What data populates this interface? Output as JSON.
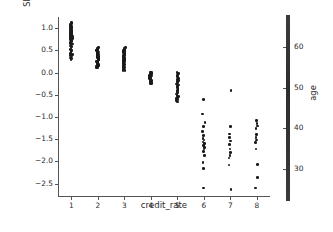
{
  "chart_data": {
    "type": "scatter",
    "title": "",
    "xlabel": "credit_rate",
    "ylabel_line1": "SHAP value for",
    "ylabel_line2": "credit_rate",
    "xlim": [
      0.5,
      8.5
    ],
    "ylim": [
      -2.8,
      1.25
    ],
    "grid": false,
    "xticks": [
      1,
      2,
      3,
      4,
      5,
      6,
      7,
      8
    ],
    "xticklabels": [
      "1",
      "2",
      "3",
      "4",
      "5",
      "6",
      "7",
      "8"
    ],
    "yticks": [
      1.0,
      0.5,
      0.0,
      -0.5,
      -1.0,
      -1.5,
      -2.0,
      -2.5
    ],
    "yticklabels": [
      "1.0",
      "0.5",
      "0.0",
      "−0.5",
      "−1.0",
      "−1.5",
      "−2.0",
      "−2.5"
    ],
    "point_color": "#1a1a1a",
    "axis_color": "#545454",
    "series": [
      {
        "name": "credit_rate = 1",
        "x": 1,
        "values": [
          1.12,
          1.1,
          1.08,
          1.06,
          1.05,
          1.04,
          1.02,
          1.01,
          1.0,
          0.99,
          0.98,
          0.96,
          0.95,
          0.94,
          0.92,
          0.91,
          0.9,
          0.88,
          0.87,
          0.86,
          0.84,
          0.83,
          0.82,
          0.8,
          0.79,
          0.78,
          0.76,
          0.75,
          0.73,
          0.72,
          0.7,
          0.68,
          0.66,
          0.64,
          0.62,
          0.6,
          0.58,
          0.55,
          0.52,
          0.5,
          0.47,
          0.45,
          0.43,
          0.41,
          0.39,
          0.37,
          0.35,
          0.33,
          0.31,
          0.29
        ]
      },
      {
        "name": "credit_rate = 2",
        "x": 2,
        "values": [
          0.57,
          0.55,
          0.54,
          0.53,
          0.52,
          0.51,
          0.5,
          0.49,
          0.48,
          0.47,
          0.46,
          0.45,
          0.44,
          0.43,
          0.42,
          0.41,
          0.4,
          0.39,
          0.38,
          0.37,
          0.36,
          0.35,
          0.34,
          0.33,
          0.32,
          0.31,
          0.3,
          0.29,
          0.28,
          0.27,
          0.26,
          0.25,
          0.24,
          0.22,
          0.21,
          0.2,
          0.19,
          0.18,
          0.17,
          0.16,
          0.15,
          0.14,
          0.13,
          0.12,
          0.11
        ]
      },
      {
        "name": "credit_rate = 3",
        "x": 3,
        "values": [
          0.56,
          0.55,
          0.54,
          0.53,
          0.52,
          0.5,
          0.49,
          0.48,
          0.47,
          0.46,
          0.45,
          0.44,
          0.43,
          0.41,
          0.4,
          0.39,
          0.38,
          0.37,
          0.36,
          0.35,
          0.34,
          0.33,
          0.31,
          0.3,
          0.29,
          0.28,
          0.27,
          0.26,
          0.25,
          0.24,
          0.22,
          0.21,
          0.2,
          0.18,
          0.17,
          0.15,
          0.14,
          0.12,
          0.11,
          0.09,
          0.08,
          0.07,
          0.06,
          0.05,
          0.04
        ]
      },
      {
        "name": "credit_rate = 4",
        "x": 4,
        "values": [
          0.01,
          0.0,
          -0.01,
          -0.02,
          -0.03,
          -0.04,
          -0.05,
          -0.06,
          -0.07,
          -0.08,
          -0.09,
          -0.1,
          -0.11,
          -0.12,
          -0.13,
          -0.14,
          -0.15,
          -0.16,
          -0.17,
          -0.18,
          -0.19,
          -0.2,
          -0.21,
          -0.22,
          -0.23,
          -0.24,
          -0.25,
          -0.26
        ]
      },
      {
        "name": "credit_rate = 5",
        "x": 5,
        "values": [
          0.0,
          -0.02,
          -0.04,
          -0.06,
          -0.08,
          -0.1,
          -0.12,
          -0.14,
          -0.16,
          -0.18,
          -0.2,
          -0.22,
          -0.24,
          -0.26,
          -0.28,
          -0.3,
          -0.32,
          -0.34,
          -0.36,
          -0.38,
          -0.4,
          -0.42,
          -0.44,
          -0.46,
          -0.48,
          -0.5,
          -0.52,
          -0.54,
          -0.56,
          -0.58,
          -0.6,
          -0.62,
          -0.64,
          -0.66
        ]
      },
      {
        "name": "credit_rate = 6",
        "x": 6,
        "values": [
          -0.6,
          -0.93,
          -1.12,
          -1.22,
          -1.32,
          -1.42,
          -1.48,
          -1.52,
          -1.56,
          -1.6,
          -1.64,
          -1.68,
          -1.72,
          -1.78,
          -1.86,
          -2.02,
          -2.16,
          -2.6
        ]
      },
      {
        "name": "credit_rate = 7",
        "x": 7,
        "values": [
          -0.4,
          -1.22,
          -1.38,
          -1.46,
          -1.54,
          -1.62,
          -1.72,
          -1.8,
          -1.86,
          -1.92,
          -2.08,
          -2.63
        ]
      },
      {
        "name": "credit_rate = 8",
        "x": 8,
        "values": [
          -1.08,
          -1.14,
          -1.2,
          -1.26,
          -1.4,
          -1.46,
          -1.52,
          -1.58,
          -1.72,
          -2.07,
          -2.36,
          -2.6
        ]
      }
    ]
  },
  "colorbar": {
    "label": "age",
    "ticks": [
      60,
      50,
      40,
      30
    ],
    "ticklabels": [
      "60",
      "50",
      "40",
      "30"
    ],
    "vmin": 22,
    "vmax": 68,
    "color_low": "#3a3a3a",
    "color_high": "#3b3b3b"
  }
}
